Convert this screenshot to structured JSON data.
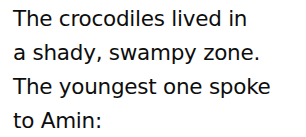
{
  "document": {
    "type": "text-passage",
    "background_color": "#ffffff",
    "text_color": "#0d0d0d",
    "alignment": "left",
    "lines": [
      {
        "text": "The crocodiles lived in"
      },
      {
        "text": "a shady, swampy zone."
      },
      {
        "text": "The youngest one spoke"
      },
      {
        "text": "to Amin:"
      }
    ],
    "full_text": "The crocodiles lived in a shady, swampy zone. The youngest one spoke to Amin:"
  }
}
